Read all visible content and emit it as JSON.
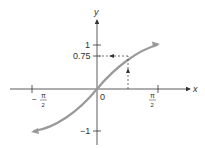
{
  "figure": {
    "axis_x_label": "x",
    "axis_y_label": "y",
    "origin_label": "0",
    "y_ticks": [
      {
        "label": "1",
        "value": 1
      },
      {
        "label": "0.75",
        "value": 0.75
      },
      {
        "label": "−1",
        "value": -1
      }
    ],
    "x_ticks": [
      {
        "numerator": "π",
        "denominator": "2",
        "sign": "−",
        "value": -1.5708
      },
      {
        "numerator": "π",
        "denominator": "2",
        "sign": "",
        "value": 1.5708
      }
    ],
    "curve": "y = sin x",
    "highlight_point": {
      "x": 0.848,
      "y": 0.75
    },
    "colors": {
      "curve": "#9a9a9a",
      "axes": "#333333",
      "dashed": "#333333"
    }
  }
}
